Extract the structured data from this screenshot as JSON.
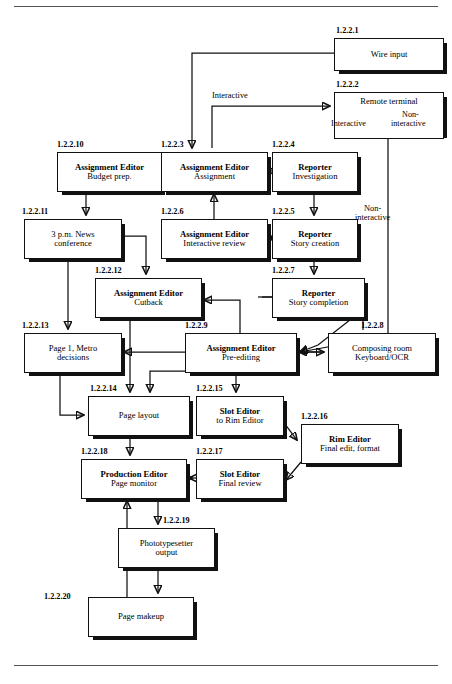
{
  "page": {
    "top_rule": true,
    "bottom_rule": true
  },
  "nodes": [
    {
      "id": "n1",
      "tag": "1.2.2.1",
      "line1": "Wire input",
      "line2": "",
      "bold1": false,
      "x": 334,
      "y": 38,
      "w": 108,
      "h": 31
    },
    {
      "id": "n2",
      "tag": "1.2.2.2",
      "line1": "Remote terminal",
      "line2": "",
      "bold1": false,
      "x": 334,
      "y": 92,
      "w": 108,
      "h": 41
    },
    {
      "id": "n3",
      "tag": "1.2.2.3",
      "line1": "Assignment Editor",
      "line2": "Assignment",
      "bold1": true,
      "x": 161,
      "y": 152,
      "w": 105,
      "h": 38
    },
    {
      "id": "n4",
      "tag": "1.2.2.4",
      "line1": "Reporter",
      "line2": "Investigation",
      "bold1": true,
      "x": 272,
      "y": 152,
      "w": 84,
      "h": 38
    },
    {
      "id": "n5",
      "tag": "1.2.2.5",
      "line1": "Reporter",
      "line2": "Story creation",
      "bold1": true,
      "x": 272,
      "y": 219,
      "w": 84,
      "h": 38
    },
    {
      "id": "n6",
      "tag": "1.2.2.6",
      "line1": "Assignment Editor",
      "line2": "Interactive review",
      "bold1": true,
      "x": 161,
      "y": 219,
      "w": 105,
      "h": 38
    },
    {
      "id": "n7",
      "tag": "1.2.2.7",
      "line1": "Reporter",
      "line2": "Story completion",
      "bold1": true,
      "x": 272,
      "y": 278,
      "w": 91,
      "h": 38
    },
    {
      "id": "n8",
      "tag": "1.2.2.8",
      "line1": "Composing room",
      "line2": "Keyboard/OCR",
      "bold1": false,
      "x": 328,
      "y": 333,
      "w": 106,
      "h": 38
    },
    {
      "id": "n9",
      "tag": "1.2.2.9",
      "line1": "Assignment Editor",
      "line2": "Pre-editing",
      "bold1": true,
      "x": 185,
      "y": 333,
      "w": 110,
      "h": 38
    },
    {
      "id": "n10",
      "tag": "1.2.2.10",
      "line1": "Assignment Editor",
      "line2": "Budget prep.",
      "bold1": true,
      "x": 57,
      "y": 152,
      "w": 103,
      "h": 38
    },
    {
      "id": "n11",
      "tag": "1.2.2.11",
      "line1": "3 p.m. News",
      "line2": "conference",
      "bold1": false,
      "x": 24,
      "y": 219,
      "w": 96,
      "h": 38
    },
    {
      "id": "n12",
      "tag": "1.2.2.12",
      "line1": "Assignment Editor",
      "line2": "Cutback",
      "bold1": true,
      "x": 95,
      "y": 278,
      "w": 105,
      "h": 38
    },
    {
      "id": "n13",
      "tag": "1.2.2.13",
      "line1": "Page 1, Metro",
      "line2": "decisions",
      "bold1": false,
      "x": 24,
      "y": 333,
      "w": 96,
      "h": 38
    },
    {
      "id": "n14",
      "tag": "1.2.2.14",
      "line1": "Page layout",
      "line2": "",
      "bold1": false,
      "x": 88,
      "y": 396,
      "w": 100,
      "h": 38
    },
    {
      "id": "n15",
      "tag": "1.2.2.15",
      "line1": "Slot Editor",
      "line2": "to Rim Editor",
      "bold1": true,
      "x": 196,
      "y": 396,
      "w": 86,
      "h": 38
    },
    {
      "id": "n16",
      "tag": "1.2.2.16",
      "line1": "Rim Editor",
      "line2": "Final edit, format",
      "bold1": true,
      "x": 301,
      "y": 424,
      "w": 96,
      "h": 38
    },
    {
      "id": "n17",
      "tag": "1.2.2.17",
      "line1": "Slot Editor",
      "line2": "Final review",
      "bold1": true,
      "x": 196,
      "y": 459,
      "w": 86,
      "h": 38
    },
    {
      "id": "n18",
      "tag": "1.2.2.18",
      "line1": "Production Editor",
      "line2": "Page monitor",
      "bold1": true,
      "x": 81,
      "y": 459,
      "w": 104,
      "h": 38
    },
    {
      "id": "n19",
      "tag": "1.2.2.19",
      "line1": "Phototypesetter",
      "line2": "output",
      "bold1": false,
      "x": 118,
      "y": 528,
      "w": 95,
      "h": 38
    },
    {
      "id": "n20",
      "tag": "1.2.2.20",
      "line1": "Page makeup",
      "line2": "",
      "bold1": false,
      "x": 88,
      "y": 597,
      "w": 104,
      "h": 38
    }
  ],
  "edge_labels": [
    {
      "id": "e_interactive",
      "text": "Interactive",
      "x": 212,
      "y": 97
    },
    {
      "id": "e_noninteractive_r",
      "text": "Non-\\ninteractive",
      "x": 373,
      "y": 210
    }
  ],
  "inbox_labels": [
    {
      "id": "lbl_interactive_in",
      "text": "Interactive",
      "x": 336,
      "y": 121
    },
    {
      "id": "lbl_noninteractive_in1",
      "text": "Non-",
      "x": 400,
      "y": 112
    },
    {
      "id": "lbl_noninteractive_in2",
      "text": "interactive",
      "x": 393,
      "y": 121
    }
  ]
}
